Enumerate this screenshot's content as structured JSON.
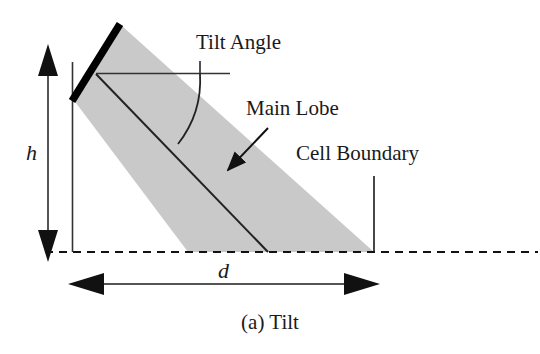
{
  "figure": {
    "caption": "(a) Tilt",
    "background_color": "#ffffff",
    "ink_color": "#1a1a1a",
    "beam_fill_color": "#c9c9c9",
    "antenna_color": "#000000"
  },
  "labels": {
    "tilt_angle": "Tilt Angle",
    "main_lobe": "Main Lobe",
    "cell_boundary": "Cell Boundary",
    "height": "h",
    "distance": "d"
  },
  "elements": {
    "antenna_name": "antenna-element",
    "beam_name": "main-lobe-beam",
    "baseline_name": "ground-baseline",
    "arc_name": "tilt-angle-arc",
    "boresight_name": "main-lobe-boresight-line",
    "horizontal_reference_name": "horizontal-reference-line",
    "mast_name": "antenna-mast-line",
    "height_arrow_name": "height-dimension-arrow",
    "distance_arrow_name": "distance-dimension-arrow",
    "cell_boundary_leader_name": "cell-boundary-leader-line",
    "main_lobe_leader_name": "main-lobe-leader-arrow",
    "tilt_angle_leader_name": "tilt-angle-leader-line"
  }
}
